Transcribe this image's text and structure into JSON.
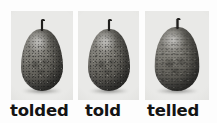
{
  "figure": {
    "kind": "three-panel-photo-figure",
    "background_color": "#fdfdfd",
    "panel_background_color": "#e9e9e7",
    "caption_text_color": "#141414"
  },
  "panels": [
    {
      "image_subject": "pear-photograph",
      "image_alt": "black and white photograph of a pear with a short stem",
      "caption": "tolded"
    },
    {
      "image_subject": "pear-photograph",
      "image_alt": "black and white photograph of a pear with a short stem",
      "caption": "told"
    },
    {
      "image_subject": "pear-photograph",
      "image_alt": "black and white photograph of a pear with a short stem",
      "caption": "telled"
    }
  ]
}
